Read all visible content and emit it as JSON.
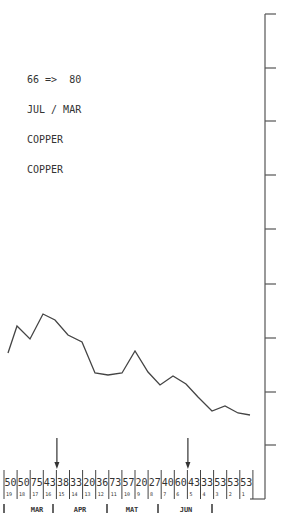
{
  "legend": {
    "lines": [
      "66 =>  80",
      "JUL / MAR",
      "COPPER",
      "COPPER"
    ]
  },
  "chart_data": {
    "type": "line",
    "title": "66 => 80 JUL / MAR COPPER COPPER",
    "xlabel": "",
    "ylabel": "",
    "grid": false,
    "legend_position": "top-left",
    "axis": {
      "side": "right",
      "tick_count": 9,
      "tick_labels": []
    },
    "series": [
      {
        "name": "COPPER",
        "points_px": [
          [
            8,
            353
          ],
          [
            17,
            326
          ],
          [
            30,
            339
          ],
          [
            43,
            314
          ],
          [
            55,
            320
          ],
          [
            68,
            335
          ],
          [
            82,
            342
          ],
          [
            95,
            373
          ],
          [
            108,
            375
          ],
          [
            122,
            373
          ],
          [
            135,
            351
          ],
          [
            148,
            372
          ],
          [
            160,
            385
          ],
          [
            173,
            376
          ],
          [
            186,
            384
          ],
          [
            198,
            397
          ],
          [
            212,
            411
          ],
          [
            225,
            406
          ],
          [
            238,
            413
          ],
          [
            250,
            415
          ]
        ]
      }
    ],
    "table": {
      "row1": [
        "50",
        "50",
        "75",
        "43",
        "38",
        "33",
        "20",
        "36",
        "73",
        "57",
        "20",
        "27",
        "40",
        "60",
        "43",
        "33",
        "53",
        "53",
        "53"
      ],
      "row2": [
        "19",
        "18",
        "17",
        "16",
        "15",
        "14",
        "13",
        "12",
        "11",
        "10",
        "9",
        "8",
        "7",
        "6",
        "5",
        "4",
        "3",
        "2",
        "1"
      ]
    },
    "months": [
      "MAR",
      "APR",
      "MAT",
      "JUN"
    ],
    "markers": [
      {
        "type": "arrow-down",
        "column": 4
      },
      {
        "type": "arrow-down",
        "column": 14
      }
    ],
    "colors": {
      "line": "#444444",
      "axis": "#555555"
    }
  }
}
